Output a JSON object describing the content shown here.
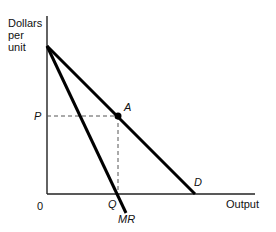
{
  "diagram": {
    "type": "monopoly-demand-marginal-revenue",
    "y_axis_label": [
      "Dollars",
      "per",
      "unit"
    ],
    "x_axis_label": "Output",
    "origin_label": "0",
    "price_label": "P",
    "quantity_label": "Q",
    "point_label": "A",
    "demand_label": "D",
    "mr_label": "MR",
    "colors": {
      "line": "#000000",
      "axis": "#222222",
      "dashed": "#555555"
    },
    "geometry": {
      "origin": [
        47,
        194
      ],
      "y_axis_top": [
        47,
        16
      ],
      "x_axis_end": [
        255,
        194
      ],
      "intercept": [
        47,
        46
      ],
      "point_A": [
        118,
        116
      ],
      "demand_end": [
        195,
        194
      ],
      "mr_end": [
        126,
        213
      ]
    }
  }
}
